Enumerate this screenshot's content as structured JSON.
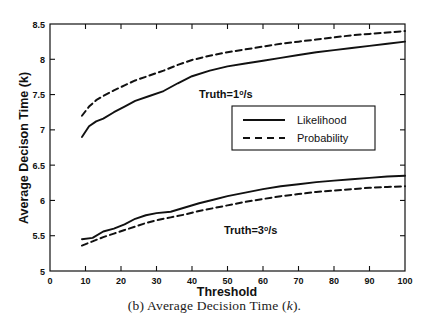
{
  "figure": {
    "caption_prefix": "(b) Average Decision Time (",
    "caption_italic": "k",
    "caption_suffix": ")."
  },
  "chart_data": {
    "type": "line",
    "title": "",
    "xlabel": "Threshold",
    "ylabel": "Average Decison Time (k)",
    "xlim": [
      0,
      100
    ],
    "ylim": [
      5,
      8.5
    ],
    "xticks": [
      0,
      10,
      20,
      30,
      40,
      50,
      60,
      70,
      80,
      90,
      100
    ],
    "xtick_labels": [
      "0",
      "10",
      "20",
      "30",
      "40",
      "50",
      "60",
      "70",
      "80",
      "90",
      "100"
    ],
    "yticks": [
      5,
      5.5,
      6,
      6.5,
      7,
      7.5,
      8,
      8.5
    ],
    "ytick_labels": [
      "5",
      "5.5",
      "6",
      "6.5",
      "7",
      "7.5",
      "8",
      "8.5"
    ],
    "grid": false,
    "legend_position": "upper-right",
    "legend": [
      {
        "name": "Likelihood",
        "style": "solid"
      },
      {
        "name": "Probability",
        "style": "dashed"
      }
    ],
    "annotations": [
      {
        "text_prefix": "Truth=1",
        "text_sup": "o",
        "text_suffix": "/s",
        "x": 42,
        "y": 7.45
      },
      {
        "text_prefix": "Truth=3",
        "text_sup": "o",
        "text_suffix": "/s",
        "x": 49,
        "y": 5.52
      }
    ],
    "groups": [
      {
        "name": "Truth=1 deg/s",
        "series": [
          {
            "name": "Likelihood",
            "style": "solid",
            "x": [
              9,
              11,
              13,
              15,
              18,
              21,
              24,
              28,
              32,
              36,
              40,
              45,
              50,
              55,
              60,
              65,
              70,
              75,
              80,
              85,
              90,
              95,
              100
            ],
            "y": [
              6.9,
              7.05,
              7.12,
              7.16,
              7.25,
              7.33,
              7.41,
              7.48,
              7.55,
              7.66,
              7.76,
              7.84,
              7.9,
              7.94,
              7.98,
              8.02,
              8.06,
              8.1,
              8.13,
              8.16,
              8.19,
              8.22,
              8.25
            ]
          },
          {
            "name": "Probability",
            "style": "dashed",
            "x": [
              9,
              11,
              13,
              15,
              18,
              21,
              24,
              28,
              32,
              36,
              40,
              45,
              50,
              55,
              60,
              65,
              70,
              75,
              80,
              85,
              90,
              95,
              100
            ],
            "y": [
              7.2,
              7.33,
              7.42,
              7.48,
              7.56,
              7.63,
              7.7,
              7.77,
              7.84,
              7.92,
              7.99,
              8.05,
              8.1,
              8.14,
              8.18,
              8.22,
              8.25,
              8.28,
              8.31,
              8.34,
              8.36,
              8.38,
              8.4
            ]
          }
        ]
      },
      {
        "name": "Truth=3 deg/s",
        "series": [
          {
            "name": "Likelihood",
            "style": "solid",
            "x": [
              9,
              12,
              15,
              18,
              21,
              24,
              27,
              30,
              34,
              38,
              42,
              46,
              50,
              55,
              60,
              65,
              70,
              75,
              80,
              85,
              90,
              95,
              100
            ],
            "y": [
              5.45,
              5.47,
              5.56,
              5.6,
              5.66,
              5.74,
              5.79,
              5.82,
              5.84,
              5.9,
              5.96,
              6.01,
              6.06,
              6.11,
              6.16,
              6.2,
              6.23,
              6.26,
              6.28,
              6.3,
              6.32,
              6.34,
              6.35
            ]
          },
          {
            "name": "Probability",
            "style": "dashed",
            "x": [
              9,
              12,
              15,
              18,
              21,
              24,
              27,
              30,
              34,
              38,
              42,
              46,
              50,
              55,
              60,
              65,
              70,
              75,
              80,
              85,
              90,
              95,
              100
            ],
            "y": [
              5.36,
              5.42,
              5.48,
              5.53,
              5.58,
              5.63,
              5.68,
              5.72,
              5.76,
              5.8,
              5.85,
              5.89,
              5.93,
              5.98,
              6.02,
              6.06,
              6.09,
              6.12,
              6.14,
              6.16,
              6.18,
              6.19,
              6.2
            ]
          }
        ]
      }
    ]
  }
}
